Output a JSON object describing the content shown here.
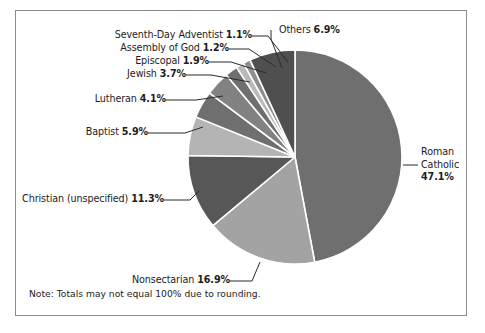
{
  "figure": {
    "note": "Note: Totals may not equal 100% due to rounding.",
    "background_color": "#ffffff",
    "border_color": "#8c8c8c",
    "separator_color": "#ffffff",
    "leader_line_color": "#2b2b2b"
  },
  "chart_data": {
    "type": "pie",
    "title": "",
    "xlabel": "",
    "ylabel": "",
    "legend_position": "none",
    "grid": false,
    "start_angle_deg": 0,
    "direction": "clockwise",
    "units": "percent",
    "categories": [
      "Roman Catholic",
      "Nonsectarian",
      "Christian (unspecified)",
      "Baptist",
      "Lutheran",
      "Jewish",
      "Episcopal",
      "Assembly of God",
      "Seventh-Day Adventist",
      "Others"
    ],
    "values": [
      47.1,
      16.9,
      11.3,
      5.9,
      4.1,
      3.7,
      1.9,
      1.2,
      1.1,
      6.9
    ],
    "colors": [
      "#6f6f6f",
      "#a3a3a3",
      "#575757",
      "#b4b4b4",
      "#6f6f6f",
      "#828282",
      "#6f6f6f",
      "#b9b9b9",
      "#8e8e8e",
      "#4f4f4f"
    ],
    "slices": [
      {
        "label": "Roman Catholic",
        "value": 47.1,
        "value_text": "47.1%",
        "color": "#6f6f6f"
      },
      {
        "label": "Nonsectarian",
        "value": 16.9,
        "value_text": "16.9%",
        "color": "#a3a3a3"
      },
      {
        "label": "Christian (unspecified)",
        "value": 11.3,
        "value_text": "11.3%",
        "color": "#575757"
      },
      {
        "label": "Baptist",
        "value": 5.9,
        "value_text": "5.9%",
        "color": "#b4b4b4"
      },
      {
        "label": "Lutheran",
        "value": 4.1,
        "value_text": "4.1%",
        "color": "#6f6f6f"
      },
      {
        "label": "Jewish",
        "value": 3.7,
        "value_text": "3.7%",
        "color": "#828282"
      },
      {
        "label": "Episcopal",
        "value": 1.9,
        "value_text": "1.9%",
        "color": "#6f6f6f"
      },
      {
        "label": "Assembly of God",
        "value": 1.2,
        "value_text": "1.2%",
        "color": "#b9b9b9"
      },
      {
        "label": "Seventh-Day Adventist",
        "value": 1.1,
        "value_text": "1.1%",
        "color": "#8e8e8e"
      },
      {
        "label": "Others",
        "value": 6.9,
        "value_text": "6.9%",
        "color": "#4f4f4f"
      }
    ]
  },
  "labels": {
    "seventh_day_adventist": {
      "name": "Seventh-Day Adventist ",
      "pct": "1.1%"
    },
    "assembly_of_god": {
      "name": "Assembly of God ",
      "pct": "1.2%"
    },
    "episcopal": {
      "name": "Episcopal ",
      "pct": "1.9%"
    },
    "jewish": {
      "name": "Jewish ",
      "pct": "3.7%"
    },
    "lutheran": {
      "name": "Lutheran ",
      "pct": "4.1%"
    },
    "baptist": {
      "name": "Baptist ",
      "pct": "5.9%"
    },
    "christian_unspecified": {
      "name": "Christian (unspecified) ",
      "pct": "11.3%"
    },
    "nonsectarian": {
      "name": "Nonsectarian ",
      "pct": "16.9%"
    },
    "others": {
      "name": "Others ",
      "pct": "6.9%"
    },
    "roman_catholic": {
      "line1": "Roman",
      "line2": "Catholic",
      "pct": "47.1%"
    }
  }
}
